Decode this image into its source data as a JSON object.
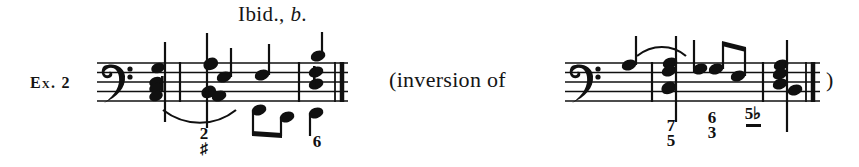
{
  "figure": {
    "heading": {
      "text_before_italic": "Ibid., ",
      "italic_part": "b",
      "text_after_italic": "."
    },
    "example_label": "Ex. 2",
    "annotation_open": "(inversion of",
    "annotation_close": ")",
    "ink_color": "#101010",
    "background_color": "#ffffff"
  },
  "staff_1": {
    "clef": "bass-clef",
    "figured_bass": [
      {
        "id": "fb-a",
        "upper": "2",
        "lower": "♯",
        "has_continuation_dash": false
      },
      {
        "id": "fb-b",
        "upper": "6",
        "lower": "",
        "has_continuation_dash": false
      }
    ],
    "measures": 3,
    "final_barline": "thin-thick-double"
  },
  "staff_2": {
    "clef": "bass-clef",
    "figured_bass": [
      {
        "id": "fb-c",
        "upper": "7",
        "lower": "5",
        "has_continuation_dash": false
      },
      {
        "id": "fb-d",
        "upper": "6",
        "lower": "3",
        "has_continuation_dash": false
      },
      {
        "id": "fb-e",
        "upper": "5♭",
        "lower": "",
        "has_continuation_dash": true
      }
    ],
    "measures": 3,
    "final_barline": "thin-thick-double"
  }
}
